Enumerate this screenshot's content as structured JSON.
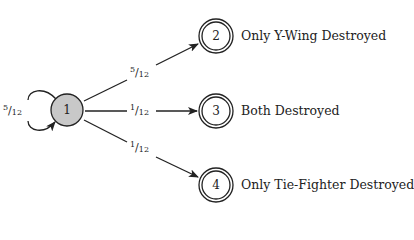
{
  "diagram": {
    "type": "markov-chain",
    "nodes": [
      {
        "id": "1",
        "label": "1",
        "fill": "#c8c8c8",
        "accepting": false,
        "description": ""
      },
      {
        "id": "2",
        "label": "2",
        "fill": "#ffffff",
        "accepting": true,
        "description": "Only Y-Wing Destroyed"
      },
      {
        "id": "3",
        "label": "3",
        "fill": "#ffffff",
        "accepting": true,
        "description": "Both Destroyed"
      },
      {
        "id": "4",
        "label": "4",
        "fill": "#ffffff",
        "accepting": true,
        "description": "Only Tie-Fighter Destroyed"
      }
    ],
    "edges": [
      {
        "from": "1",
        "to": "1",
        "num": "5",
        "den": "12"
      },
      {
        "from": "1",
        "to": "2",
        "num": "5",
        "den": "12"
      },
      {
        "from": "1",
        "to": "3",
        "num": "1",
        "den": "12"
      },
      {
        "from": "1",
        "to": "4",
        "num": "1",
        "den": "12"
      }
    ]
  }
}
